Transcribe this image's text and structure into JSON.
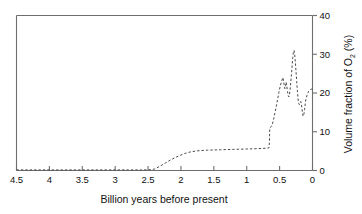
{
  "chart_data": {
    "type": "line",
    "title": "",
    "xlabel": "Billion  years before present",
    "ylabel": "Volume fraction of O",
    "ylabel_sub": "2",
    "ylabel_suffix": " (%)",
    "xlim": [
      4.5,
      0
    ],
    "ylim": [
      0,
      40
    ],
    "x_reversed": true,
    "grid": false,
    "legend": null,
    "line_style": "dashed",
    "xticks": [
      4.5,
      4,
      3.5,
      3,
      2.5,
      2,
      1.5,
      1,
      0.5,
      0
    ],
    "xticklabels": [
      "4.5",
      "4",
      "3.5",
      "3",
      "2.5",
      "2",
      "1.5",
      "1",
      "0.5",
      "0"
    ],
    "yticks": [
      0,
      10,
      20,
      30,
      40
    ],
    "yticklabels": [
      "0",
      "10",
      "20",
      "30",
      "40"
    ],
    "y_axis_position": "right",
    "series": [
      {
        "name": "Atmospheric oxygen",
        "x": [
          4.5,
          4.2,
          3.9,
          3.6,
          3.3,
          3.0,
          2.8,
          2.6,
          2.45,
          2.4,
          2.32,
          2.24,
          2.16,
          2.08,
          2.0,
          1.94,
          1.88,
          1.82,
          1.76,
          1.7,
          1.6,
          1.5,
          1.4,
          1.3,
          1.2,
          1.1,
          1.0,
          0.9,
          0.82,
          0.76,
          0.7,
          0.68,
          0.66,
          0.655,
          0.65,
          0.63,
          0.61,
          0.59,
          0.57,
          0.55,
          0.53,
          0.51,
          0.49,
          0.47,
          0.45,
          0.44,
          0.43,
          0.42,
          0.41,
          0.4,
          0.39,
          0.38,
          0.37,
          0.36,
          0.35,
          0.34,
          0.33,
          0.32,
          0.31,
          0.3,
          0.29,
          0.28,
          0.27,
          0.26,
          0.25,
          0.24,
          0.23,
          0.22,
          0.21,
          0.2,
          0.19,
          0.18,
          0.17,
          0.16,
          0.15,
          0.14,
          0.13,
          0.12,
          0.11,
          0.1,
          0.08,
          0.06,
          0.04,
          0.02,
          0.0
        ],
        "y": [
          0.15,
          0.15,
          0.15,
          0.15,
          0.15,
          0.15,
          0.15,
          0.15,
          0.2,
          0.4,
          1.1,
          1.9,
          2.7,
          3.4,
          4.0,
          4.4,
          4.7,
          4.9,
          5.05,
          5.15,
          5.25,
          5.3,
          5.35,
          5.4,
          5.45,
          5.5,
          5.55,
          5.6,
          5.65,
          5.7,
          5.75,
          5.8,
          5.85,
          7.5,
          10.9,
          11.3,
          12.0,
          13.3,
          15.0,
          16.6,
          18.4,
          20.2,
          21.8,
          23.0,
          24.0,
          23.1,
          22.0,
          21.1,
          21.9,
          22.8,
          21.6,
          20.4,
          19.4,
          19.0,
          19.6,
          21.0,
          22.8,
          24.8,
          27.0,
          29.2,
          30.6,
          31.0,
          29.8,
          27.8,
          25.4,
          23.0,
          20.6,
          18.6,
          17.3,
          17.0,
          17.4,
          17.8,
          17.4,
          16.0,
          14.4,
          14.0,
          14.6,
          15.8,
          17.2,
          18.4,
          19.6,
          20.4,
          20.8,
          21.0,
          21.0
        ]
      }
    ],
    "annotations": []
  },
  "axes": {
    "x_title": "Billion  years before present",
    "y_title_main": "Volume fraction of O",
    "y_title_sub": "2",
    "y_title_tail": " (%)"
  }
}
